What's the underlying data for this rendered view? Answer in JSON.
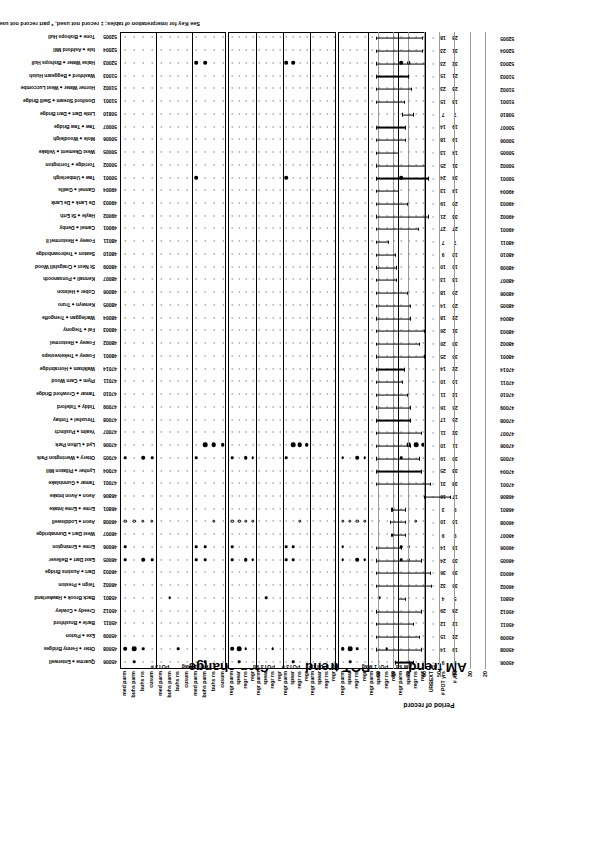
{
  "figure": {
    "footnote": "See Key for interpretation of tables; ‡ record not used, * part record not used for frequency analysis",
    "period_axis_title": "Period of record",
    "period_y_ticks": [
      "90",
      "80",
      "70",
      "60",
      "50",
      "40",
      "30",
      "20"
    ]
  },
  "panels": [
    {
      "title": "Step change",
      "groups": [
        {
          "label": "POT3 #",
          "rows": [
            "med parm",
            "buhs parm",
            "buhs ns",
            "cusum"
          ]
        },
        {
          "label": "POT3 Mag",
          "rows": [
            "med parm",
            "buhs parm",
            "buhs ns",
            "cusum"
          ]
        },
        {
          "label": "AM",
          "rows": [
            "med parm",
            "buhs parm",
            "buhs ns",
            "cusum"
          ]
        }
      ]
    },
    {
      "title": "POT trend",
      "groups": [
        {
          "label": "POT3 sd",
          "rows": [
            "regr parm",
            "spear",
            "regr ns",
            "regr"
          ]
        },
        {
          "label": "POT3 #",
          "rows": [
            "regr parm",
            "spear",
            "regr ns",
            "regr"
          ]
        },
        {
          "label": "POT1 #",
          "rows": [
            "regr parm",
            "spear",
            "regr ns",
            "regr"
          ]
        },
        {
          "label": "POT3 Mag",
          "rows": [
            "regr parm",
            "spear",
            "regr ns",
            "regr"
          ]
        }
      ]
    },
    {
      "title": "AM trend",
      "groups": [
        {
          "label": "POT1 Mag",
          "rows": [
            "regr parm",
            "spear",
            "regr ns",
            "regr"
          ]
        },
        {
          "label": "AM sd",
          "rows": [
            "regr parm",
            "spear",
            "regr ns",
            "regr"
          ]
        },
        {
          "label": "AM",
          "rows": [
            "regr parm",
            "spear",
            "regr ns",
            "regr"
          ]
        }
      ]
    }
  ],
  "count_rows": [
    {
      "label": "URBEXT"
    },
    {
      "label": "# POT yrs"
    },
    {
      "label": "# AM"
    }
  ],
  "stations": [
    {
      "code": "45006",
      "name": "Quarme ● Enterwell",
      "am": 9,
      "pot": 9,
      "start": 1967,
      "end": 1979
    },
    {
      "code": "45008",
      "name": "Otter ● Fenny Bridges",
      "am": 19,
      "pot": 14,
      "start": 1962,
      "end": 1991
    },
    {
      "code": "45009",
      "name": "Exe ● Pixton",
      "am": 22,
      "pot": 15,
      "start": 1963,
      "end": 1991
    },
    {
      "code": "45011",
      "name": "Barle ● Brushford",
      "am": 12,
      "pot": 12,
      "start": 1967,
      "end": 1991
    },
    {
      "code": "45012",
      "name": "Creedy ● Cowley",
      "am": 28,
      "pot": 29,
      "start": 1962,
      "end": 1991
    },
    {
      "code": "45801",
      "name": "Back Brook ● Hawkerland",
      "am": 5,
      "pot": 4,
      "start": 1972,
      "end": 1977
    },
    {
      "code": "46002",
      "name": "Teign ● Preston",
      "am": 36,
      "pot": 32,
      "start": 1955,
      "end": 1991
    },
    {
      "code": "46003",
      "name": "Dart ● Austins Bridge",
      "am": 36,
      "pot": 36,
      "start": 1956,
      "end": 1991
    },
    {
      "code": "46005",
      "name": "East Dart ● Bellever",
      "am": 30,
      "pot": 24,
      "start": 1962,
      "end": 1991
    },
    {
      "code": "46006",
      "name": "Erme ● Ermington",
      "am": 16,
      "pot": 14,
      "start": 1975,
      "end": 1991
    },
    {
      "code": "46007",
      "name": "West Dart ● Dunnabridge",
      "am": 9,
      "pot": 9,
      "start": 1972,
      "end": 1981
    },
    {
      "code": "46008",
      "name": "Avon ● Loddiswell",
      "am": 10,
      "pot": 10,
      "start": 1972,
      "end": 1982
    },
    {
      "code": "46801",
      "name": "Erme ● Erme Intake",
      "am": 9,
      "pot": 3,
      "start": 1972,
      "end": 1981
    },
    {
      "code": "46806",
      "name": "Avon ● Avon Intake",
      "am": 17,
      "pot": 16,
      "start": 1943,
      "end": 1960
    },
    {
      "code": "47001",
      "name": "Tamar ● Gunnislake",
      "am": 38,
      "pot": 31,
      "start": 1956,
      "end": 1991
    },
    {
      "code": "47004",
      "name": "Lynher ● Pillaton Mill",
      "am": 33,
      "pot": 25,
      "start": 1962,
      "end": 1991
    },
    {
      "code": "47005",
      "name": "Ottery ● Werrington Park",
      "am": 30,
      "pot": 19,
      "start": 1963,
      "end": 1991
    },
    {
      "code": "47006",
      "name": "Lyd ● Lifton Park",
      "am": 11,
      "pot": 10,
      "start": 1969,
      "end": 1991
    },
    {
      "code": "47007",
      "name": "Yealm ● Puslinch",
      "am": 32,
      "pot": 11,
      "start": 1962,
      "end": 1991
    },
    {
      "code": "47008",
      "name": "Thrushel ● Tinhay",
      "am": 25,
      "pot": 17,
      "start": 1969,
      "end": 1991
    },
    {
      "code": "47009",
      "name": "Tiddy ● Tideford",
      "am": 26,
      "pot": 16,
      "start": 1969,
      "end": 1991
    },
    {
      "code": "47010",
      "name": "Tamar ● Crowford Bridge",
      "am": 12,
      "pot": 11,
      "start": 1971,
      "end": 1991
    },
    {
      "code": "47011",
      "name": "Plym ● Carn Wood",
      "am": 10,
      "pot": 10,
      "start": 1974,
      "end": 1991
    },
    {
      "code": "47014",
      "name": "Walkham ● Horrabridge",
      "am": 22,
      "pot": 14,
      "start": 1973,
      "end": 1991
    },
    {
      "code": "48001",
      "name": "Fowey ● Trekeivesteps",
      "am": 35,
      "pot": 25,
      "start": 1960,
      "end": 1991
    },
    {
      "code": "48002",
      "name": "Fowey ● Restormel",
      "am": 30,
      "pot": 20,
      "start": 1963,
      "end": 1991
    },
    {
      "code": "48003",
      "name": "Fal ● Tregony",
      "am": 31,
      "pot": 26,
      "start": 1960,
      "end": 1991
    },
    {
      "code": "48004",
      "name": "Warleggan ● Trengoffe",
      "am": 22,
      "pot": 18,
      "start": 1969,
      "end": 1991
    },
    {
      "code": "48005",
      "name": "Kenwyn ● Truro",
      "am": 20,
      "pot": 14,
      "start": 1969,
      "end": 1991
    },
    {
      "code": "48006",
      "name": "Cober ● Helston",
      "am": 20,
      "pot": 18,
      "start": 1971,
      "end": 1991
    },
    {
      "code": "48007",
      "name": "Kennall ● Ponsanooth",
      "am": 13,
      "pot": 13,
      "start": 1978,
      "end": 1991
    },
    {
      "code": "48009",
      "name": "St Neot ● Craigshill Wood",
      "am": 10,
      "pot": 10,
      "start": 1978,
      "end": 1991
    },
    {
      "code": "48010",
      "name": "Seaton ● Trebrownbridge",
      "am": 10,
      "pot": 9,
      "start": 1979,
      "end": 1991
    },
    {
      "code": "48011",
      "name": "Fowey ● Restormel II",
      "am": 7,
      "pot": 7,
      "start": 1983,
      "end": 1991
    },
    {
      "code": "49001",
      "name": "Camel ● Denby",
      "am": 27,
      "pot": 27,
      "start": 1964,
      "end": 1991
    },
    {
      "code": "49002",
      "name": "Hayle ● St Erth",
      "am": 33,
      "pot": 21,
      "start": 1957,
      "end": 1991
    },
    {
      "code": "49003",
      "name": "De Lank ● De Lank",
      "am": 20,
      "pot": 19,
      "start": 1971,
      "end": 1991
    },
    {
      "code": "49004",
      "name": "Gannel ● Gwills",
      "am": 14,
      "pot": 13,
      "start": 1977,
      "end": 1991
    },
    {
      "code": "50001",
      "name": "Taw ● Umberleigh",
      "am": 34,
      "pot": 24,
      "start": 1957,
      "end": 1991
    },
    {
      "code": "50002",
      "name": "Torridge ● Torrington",
      "am": 31,
      "pot": 25,
      "start": 1959,
      "end": 1991
    },
    {
      "code": "50005",
      "name": "West Okement ● Vellake",
      "am": 14,
      "pot": 13,
      "start": 1977,
      "end": 1991
    },
    {
      "code": "50006",
      "name": "Mole ● Woodleigh",
      "am": 19,
      "pot": 18,
      "start": 1972,
      "end": 1991
    },
    {
      "code": "50007",
      "name": "Taw ● Taw Bridge",
      "am": 19,
      "pot": 14,
      "start": 1972,
      "end": 1991
    },
    {
      "code": "50810",
      "name": "Little Dart ● Dart Bridge",
      "am": 7,
      "pot": 7,
      "start": 1967,
      "end": 1974
    },
    {
      "code": "51001",
      "name": "Doniford Stream ● Swill Bridge",
      "am": 18,
      "pot": 15,
      "start": 1973,
      "end": 1991
    },
    {
      "code": "51002",
      "name": "Horner Water ● West Luccombe",
      "am": 23,
      "pot": 23,
      "start": 1968,
      "end": 1991
    },
    {
      "code": "51003",
      "name": "Washford ● Beggearn Huish",
      "am": 21,
      "pot": 15,
      "start": 1970,
      "end": 1991
    },
    {
      "code": "52003",
      "name": "Halse Water ● Bishops Hull",
      "am": 32,
      "pot": 23,
      "start": 1959,
      "end": 1991
    },
    {
      "code": "52004",
      "name": "Isle ● Ashford Mill",
      "am": 31,
      "pot": 23,
      "start": 1961,
      "end": 1991
    },
    {
      "code": "52005",
      "name": "Tone ● Bishops Hull",
      "am": 28,
      "pot": 18,
      "start": 1961,
      "end": 1991
    }
  ],
  "matrix": {
    "step_change": [
      [
        0,
        2,
        0,
        0,
        0,
        0,
        0,
        0,
        0,
        2,
        0,
        0
      ],
      [
        3,
        4,
        2,
        0,
        0,
        0,
        2,
        0,
        0,
        0,
        0,
        0
      ],
      [
        0,
        0,
        0,
        0,
        0,
        0,
        0,
        0,
        0,
        0,
        0,
        0
      ],
      [
        0,
        0,
        0,
        0,
        0,
        0,
        0,
        0,
        0,
        0,
        0,
        0
      ],
      [
        0,
        0,
        0,
        0,
        0,
        0,
        0,
        0,
        0,
        0,
        0,
        0
      ],
      [
        0,
        0,
        0,
        0,
        0,
        2,
        0,
        0,
        0,
        0,
        0,
        0
      ],
      [
        0,
        0,
        0,
        0,
        0,
        0,
        0,
        0,
        0,
        0,
        0,
        0
      ],
      [
        0,
        0,
        0,
        0,
        0,
        0,
        0,
        0,
        0,
        0,
        0,
        0
      ],
      [
        2,
        0,
        3,
        2,
        0,
        0,
        0,
        0,
        2,
        2,
        0,
        0
      ],
      [
        2,
        0,
        0,
        0,
        0,
        0,
        0,
        0,
        2,
        2,
        0,
        0
      ],
      [
        0,
        0,
        0,
        0,
        0,
        0,
        0,
        0,
        0,
        0,
        0,
        0
      ],
      [
        -1,
        -1,
        -1,
        -1,
        0,
        0,
        0,
        0,
        0,
        0,
        -1,
        0
      ],
      [
        0,
        0,
        0,
        0,
        0,
        0,
        0,
        0,
        0,
        0,
        0,
        0
      ],
      [
        0,
        0,
        0,
        0,
        0,
        0,
        0,
        0,
        0,
        0,
        0,
        0
      ],
      [
        0,
        0,
        0,
        0,
        0,
        0,
        0,
        0,
        0,
        0,
        0,
        0
      ],
      [
        0,
        0,
        0,
        0,
        0,
        0,
        0,
        0,
        0,
        0,
        0,
        0
      ],
      [
        2,
        0,
        3,
        2,
        0,
        0,
        0,
        0,
        2,
        0,
        0,
        0
      ],
      [
        0,
        0,
        0,
        0,
        0,
        0,
        0,
        0,
        0,
        4,
        4,
        3
      ],
      [
        0,
        0,
        0,
        0,
        0,
        0,
        0,
        0,
        0,
        0,
        0,
        0
      ],
      [
        0,
        0,
        0,
        0,
        0,
        0,
        0,
        0,
        0,
        0,
        0,
        0
      ],
      [
        0,
        0,
        0,
        0,
        0,
        0,
        0,
        0,
        0,
        0,
        0,
        0
      ],
      [
        0,
        0,
        0,
        0,
        0,
        0,
        0,
        0,
        0,
        0,
        0,
        0
      ],
      [
        0,
        0,
        0,
        0,
        0,
        0,
        0,
        0,
        0,
        0,
        0,
        0
      ],
      [
        0,
        0,
        0,
        0,
        0,
        0,
        0,
        0,
        0,
        0,
        0,
        0
      ],
      [
        0,
        0,
        0,
        0,
        0,
        0,
        0,
        0,
        0,
        0,
        0,
        0
      ],
      [
        0,
        0,
        0,
        0,
        0,
        0,
        0,
        0,
        0,
        0,
        0,
        0
      ],
      [
        0,
        0,
        0,
        0,
        0,
        0,
        0,
        0,
        0,
        0,
        0,
        0
      ],
      [
        0,
        0,
        0,
        0,
        0,
        0,
        0,
        0,
        0,
        0,
        0,
        0
      ],
      [
        0,
        0,
        0,
        0,
        0,
        0,
        0,
        0,
        0,
        0,
        0,
        0
      ],
      [
        0,
        0,
        0,
        0,
        0,
        0,
        0,
        0,
        0,
        0,
        0,
        0
      ],
      [
        0,
        0,
        0,
        0,
        0,
        0,
        0,
        0,
        0,
        0,
        0,
        0
      ],
      [
        0,
        0,
        0,
        0,
        0,
        0,
        0,
        0,
        0,
        0,
        0,
        0
      ],
      [
        0,
        0,
        0,
        0,
        0,
        0,
        0,
        0,
        0,
        0,
        0,
        0
      ],
      [
        0,
        0,
        0,
        0,
        0,
        0,
        0,
        0,
        0,
        0,
        0,
        0
      ],
      [
        0,
        0,
        0,
        0,
        0,
        0,
        0,
        0,
        0,
        0,
        0,
        0
      ],
      [
        0,
        0,
        0,
        0,
        0,
        0,
        0,
        0,
        0,
        0,
        0,
        0
      ],
      [
        0,
        0,
        0,
        0,
        0,
        0,
        0,
        0,
        0,
        0,
        0,
        0
      ],
      [
        0,
        0,
        0,
        0,
        0,
        0,
        0,
        0,
        0,
        0,
        0,
        0
      ],
      [
        0,
        0,
        0,
        0,
        0,
        0,
        0,
        0,
        3,
        0,
        0,
        0
      ],
      [
        0,
        0,
        0,
        0,
        0,
        0,
        0,
        0,
        0,
        0,
        0,
        0
      ],
      [
        0,
        0,
        0,
        0,
        0,
        0,
        0,
        0,
        0,
        0,
        0,
        0
      ],
      [
        0,
        0,
        0,
        0,
        0,
        0,
        0,
        0,
        0,
        0,
        0,
        0
      ],
      [
        0,
        0,
        0,
        0,
        0,
        0,
        0,
        0,
        0,
        0,
        0,
        0
      ],
      [
        0,
        0,
        0,
        0,
        0,
        0,
        0,
        0,
        0,
        0,
        0,
        0
      ],
      [
        0,
        0,
        0,
        0,
        0,
        0,
        0,
        0,
        0,
        0,
        0,
        0
      ],
      [
        0,
        0,
        0,
        0,
        0,
        0,
        0,
        0,
        0,
        0,
        0,
        0
      ],
      [
        0,
        0,
        0,
        0,
        0,
        0,
        0,
        0,
        0,
        0,
        0,
        0
      ],
      [
        0,
        0,
        0,
        0,
        0,
        0,
        0,
        0,
        3,
        3,
        0,
        0
      ],
      [
        0,
        0,
        0,
        0,
        0,
        0,
        0,
        0,
        0,
        0,
        0,
        0
      ],
      [
        0,
        0,
        0,
        0,
        0,
        0,
        0,
        0,
        0,
        0,
        0,
        0
      ]
    ]
  }
}
